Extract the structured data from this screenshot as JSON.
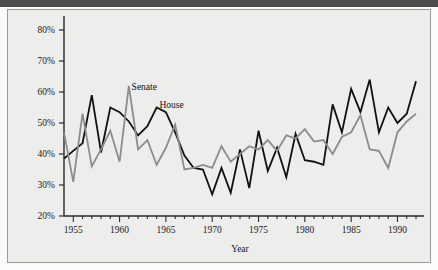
{
  "figure": {
    "background_color": "#ededec",
    "top_bar_color": "#4c4c4c",
    "border_color": "#9a9a9a"
  },
  "chart_data": {
    "type": "line",
    "title": "",
    "xlabel": "Year",
    "ylabel": "",
    "xlim": [
      1954,
      1992
    ],
    "ylim": [
      20,
      80
    ],
    "grid": false,
    "legend_position": "inline-annotation",
    "x_tick_labels": [
      "1955",
      "1960",
      "1965",
      "1970",
      "1975",
      "1980",
      "1985",
      "1990"
    ],
    "x_tick_values": [
      1955,
      1960,
      1965,
      1970,
      1975,
      1980,
      1985,
      1990
    ],
    "x_minor_tick_interval": 1,
    "y_tick_labels": [
      "20%",
      "30%",
      "40%",
      "50%",
      "60%",
      "70%",
      "80%"
    ],
    "y_tick_values": [
      20,
      30,
      40,
      50,
      60,
      70,
      80
    ],
    "x": [
      1954,
      1955,
      1956,
      1957,
      1958,
      1959,
      1960,
      1961,
      1962,
      1963,
      1964,
      1965,
      1966,
      1967,
      1968,
      1969,
      1970,
      1971,
      1972,
      1973,
      1974,
      1975,
      1976,
      1977,
      1978,
      1979,
      1980,
      1981,
      1982,
      1983,
      1984,
      1985,
      1986,
      1987,
      1988,
      1989,
      1990,
      1991,
      1992
    ],
    "series": [
      {
        "name": "House",
        "color": "#111111",
        "line_width": 1.8,
        "annotation_label": "House",
        "values": [
          38.5,
          41.0,
          43.5,
          59.0,
          40.5,
          55.0,
          53.5,
          50.5,
          46.0,
          49.0,
          55.0,
          53.5,
          47.0,
          39.5,
          35.5,
          35.0,
          27.0,
          35.5,
          27.5,
          41.5,
          29.0,
          47.5,
          34.5,
          42.0,
          32.5,
          46.5,
          38.0,
          37.5,
          36.5,
          56.0,
          47.0,
          61.0,
          53.5,
          64.0,
          47.0,
          55.0,
          50.0,
          53.0,
          63.5
        ]
      },
      {
        "name": "Senate",
        "color": "#8c8c8c",
        "line_width": 1.8,
        "annotation_label": "Senate",
        "values": [
          47.0,
          31.0,
          53.0,
          36.0,
          41.5,
          47.5,
          37.5,
          62.0,
          41.5,
          44.5,
          36.5,
          42.0,
          49.5,
          35.0,
          35.5,
          36.5,
          35.5,
          42.5,
          37.5,
          40.0,
          42.5,
          41.5,
          44.5,
          41.0,
          46.0,
          45.0,
          48.0,
          44.0,
          44.5,
          40.0,
          45.5,
          47.0,
          52.5,
          41.5,
          41.0,
          35.5,
          47.0,
          50.5,
          53.0
        ]
      }
    ],
    "annotations": [
      {
        "text": "Senate",
        "x": 1961.3,
        "y": 60.5
      },
      {
        "text": "House",
        "x": 1964.3,
        "y": 55.0
      }
    ]
  }
}
